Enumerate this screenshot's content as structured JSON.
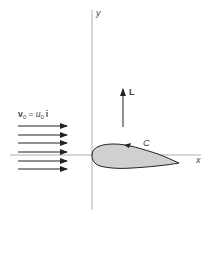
{
  "diagram": {
    "axes": {
      "x_label": "x",
      "y_label": "y"
    },
    "flow": {
      "label_v": "v",
      "label_v_sub": "0",
      "label_eq": " = ",
      "label_u": "u",
      "label_u_sub": "0",
      "label_i": "i",
      "arrow_count": 6
    },
    "lift": {
      "label": "L"
    },
    "airfoil": {
      "contour_label": "C",
      "fill_color": "#d0d0d0"
    },
    "colors": {
      "axis": "#999999",
      "stroke": "#222222"
    }
  }
}
